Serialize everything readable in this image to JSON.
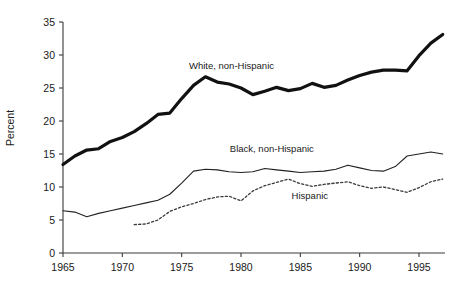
{
  "chart_data": {
    "type": "line",
    "title": "",
    "xlabel": "",
    "ylabel": "Percent",
    "xlim": [
      1964.2,
      1997.8
    ],
    "ylim": [
      0,
      35
    ],
    "yticks": [
      0,
      5,
      10,
      15,
      20,
      25,
      30,
      35
    ],
    "ytick_labels": [
      "0",
      "5",
      "10",
      "15",
      "20",
      "25",
      "30",
      "35"
    ],
    "xticks": [
      1965,
      1970,
      1975,
      1980,
      1985,
      1990,
      1995
    ],
    "xtick_labels": [
      "1965",
      "1970",
      "1975",
      "1980",
      "1985",
      "1990",
      "1995"
    ],
    "grid": false,
    "legend_position": "inline-annotations",
    "series": [
      {
        "name": "White, non-Hispanic",
        "style": "thick-solid",
        "color": "#111111",
        "label_x": 1979.2,
        "label_y": 27.9,
        "x": [
          1965,
          1966,
          1967,
          1968,
          1969,
          1970,
          1971,
          1972,
          1973,
          1974,
          1975,
          1976,
          1977,
          1978,
          1979,
          1980,
          1981,
          1982,
          1983,
          1984,
          1985,
          1986,
          1987,
          1988,
          1989,
          1990,
          1991,
          1992,
          1993,
          1994,
          1995,
          1996,
          1997
        ],
        "values": [
          13.4,
          14.7,
          15.6,
          15.8,
          16.9,
          17.5,
          18.4,
          19.6,
          21.0,
          21.2,
          23.4,
          25.4,
          26.7,
          25.9,
          25.6,
          25.0,
          24.0,
          24.5,
          25.1,
          24.6,
          24.9,
          25.7,
          25.1,
          25.4,
          26.2,
          26.9,
          27.4,
          27.7,
          27.7,
          27.6,
          29.9,
          31.8,
          33.1
        ]
      },
      {
        "name": "Black, non-Hispanic",
        "style": "thin-solid",
        "color": "#222222",
        "label_x": 1982.6,
        "label_y": 15.3,
        "x": [
          1965,
          1966,
          1967,
          1968,
          1969,
          1970,
          1971,
          1972,
          1973,
          1974,
          1975,
          1976,
          1977,
          1978,
          1979,
          1980,
          1981,
          1982,
          1983,
          1984,
          1985,
          1986,
          1987,
          1988,
          1989,
          1990,
          1991,
          1992,
          1993,
          1994,
          1995,
          1996,
          1997
        ],
        "values": [
          6.4,
          6.2,
          5.5,
          6.0,
          6.4,
          6.8,
          7.2,
          7.6,
          8.0,
          8.9,
          10.6,
          12.4,
          12.7,
          12.6,
          12.3,
          12.2,
          12.3,
          12.8,
          12.6,
          12.4,
          12.2,
          12.3,
          12.4,
          12.7,
          13.3,
          12.9,
          12.5,
          12.4,
          13.1,
          14.7,
          15.0,
          15.3,
          15.0
        ]
      },
      {
        "name": "Hispanic",
        "style": "dotted",
        "color": "#3b3b3b",
        "label_x": 1985.8,
        "label_y": 8.2,
        "x": [
          1971,
          1972,
          1973,
          1974,
          1975,
          1976,
          1977,
          1978,
          1979,
          1980,
          1981,
          1982,
          1983,
          1984,
          1985,
          1986,
          1987,
          1988,
          1989,
          1990,
          1991,
          1992,
          1993,
          1994,
          1995,
          1996,
          1997
        ],
        "values": [
          4.3,
          4.4,
          5.0,
          6.3,
          7.0,
          7.5,
          8.1,
          8.5,
          8.6,
          7.9,
          9.4,
          10.2,
          10.7,
          11.2,
          10.5,
          10.1,
          10.4,
          10.6,
          10.8,
          10.2,
          9.8,
          10.0,
          9.6,
          9.2,
          9.9,
          10.8,
          11.2
        ]
      }
    ]
  }
}
